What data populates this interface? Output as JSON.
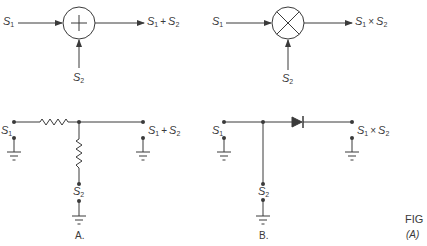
{
  "figure": {
    "label": "FIG",
    "sublabel": "(A)"
  },
  "panels": [
    {
      "id": "A",
      "caption": "A.",
      "block": {
        "operator": "summer",
        "symbol": "+",
        "inputs": [
          {
            "name": "S",
            "sub": "1"
          },
          {
            "name": "S",
            "sub": "2"
          }
        ],
        "output": {
          "left": {
            "name": "S",
            "sub": "1"
          },
          "op": "+",
          "right": {
            "name": "S",
            "sub": "2"
          }
        }
      },
      "circuit": {
        "components": [
          "series-resistor",
          "shunt-resistor",
          "ground",
          "ground",
          "ground"
        ],
        "input1": {
          "name": "S",
          "sub": "1"
        },
        "input2": {
          "name": "S",
          "sub": "2"
        },
        "output": {
          "left": {
            "name": "S",
            "sub": "1"
          },
          "op": "+",
          "right": {
            "name": "S",
            "sub": "2"
          }
        }
      }
    },
    {
      "id": "B",
      "caption": "B.",
      "block": {
        "operator": "multiplier",
        "symbol": "×",
        "inputs": [
          {
            "name": "S",
            "sub": "1"
          },
          {
            "name": "S",
            "sub": "2"
          }
        ],
        "output": {
          "left": {
            "name": "S",
            "sub": "1"
          },
          "op": "×",
          "right": {
            "name": "S",
            "sub": "2"
          }
        }
      },
      "circuit": {
        "components": [
          "diode",
          "ground",
          "ground",
          "ground"
        ],
        "input1": {
          "name": "S",
          "sub": "1"
        },
        "input2": {
          "name": "S",
          "sub": "2"
        },
        "output": {
          "left": {
            "name": "S",
            "sub": "1"
          },
          "op": "×",
          "right": {
            "name": "S",
            "sub": "2"
          }
        }
      }
    }
  ],
  "colors": {
    "ink": "#3a3a3a",
    "background": "#ffffff"
  }
}
